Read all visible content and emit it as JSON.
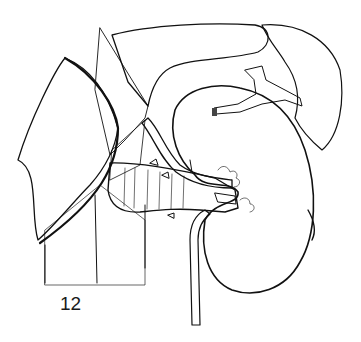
{
  "figure": {
    "label": "12",
    "colors": {
      "ink": "#111111",
      "background": "#ffffff",
      "stipple": "#b8b8b8"
    }
  }
}
